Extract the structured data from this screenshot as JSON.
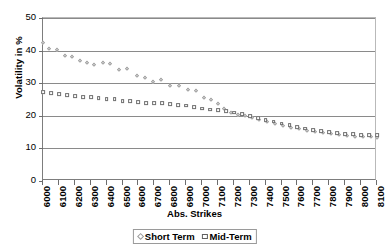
{
  "chart_data": {
    "type": "scatter",
    "title": "",
    "xlabel": "Abs. Strikes",
    "ylabel": "Volatility in %",
    "ylim": [
      0,
      50
    ],
    "ytick_labels": [
      "50",
      "40",
      "30",
      "20",
      "10",
      "0"
    ],
    "ytick_values": [
      50,
      40,
      30,
      20,
      10,
      0
    ],
    "grid": "horizontal",
    "legend_position": "bottom",
    "xtick_labels": [
      "6000",
      "6100",
      "6200",
      "6300",
      "6400",
      "6500",
      "6600",
      "6700",
      "6800",
      "6900",
      "7000",
      "7100",
      "7200",
      "7300",
      "7400",
      "7500",
      "7600",
      "7700",
      "7800",
      "7900",
      "8000",
      "8100"
    ],
    "x_min": 6000,
    "x_max": 8100,
    "series": [
      {
        "name": "Short Term",
        "marker": "diamond",
        "color": "#9a9a9a",
        "points": [
          [
            6000,
            42.3
          ],
          [
            6040,
            40.6
          ],
          [
            6085,
            40.2
          ],
          [
            6140,
            38.4
          ],
          [
            6185,
            37.9
          ],
          [
            6230,
            36.8
          ],
          [
            6275,
            36.3
          ],
          [
            6320,
            35.7
          ],
          [
            6375,
            36.2
          ],
          [
            6420,
            36.0
          ],
          [
            6480,
            34.0
          ],
          [
            6530,
            34.3
          ],
          [
            6590,
            32.1
          ],
          [
            6640,
            31.7
          ],
          [
            6690,
            30.4
          ],
          [
            6740,
            30.9
          ],
          [
            6800,
            29.1
          ],
          [
            6855,
            29.2
          ],
          [
            6910,
            27.8
          ],
          [
            6960,
            27.6
          ],
          [
            7010,
            25.4
          ],
          [
            7055,
            24.7
          ],
          [
            7100,
            23.6
          ],
          [
            7140,
            22.1
          ],
          [
            7180,
            21.0
          ],
          [
            7225,
            20.3
          ],
          [
            7270,
            19.8
          ],
          [
            7315,
            19.3
          ],
          [
            7360,
            18.7
          ],
          [
            7410,
            18.2
          ],
          [
            7460,
            17.5
          ],
          [
            7510,
            17.0
          ],
          [
            7560,
            16.3
          ],
          [
            7610,
            15.8
          ],
          [
            7660,
            15.4
          ],
          [
            7710,
            15.0
          ],
          [
            7760,
            14.6
          ],
          [
            7810,
            14.3
          ],
          [
            7860,
            14.0
          ],
          [
            7910,
            13.8
          ],
          [
            7960,
            13.6
          ],
          [
            8010,
            13.5
          ],
          [
            8060,
            13.4
          ],
          [
            8100,
            13.3
          ]
        ]
      },
      {
        "name": "Mid-Term",
        "marker": "square",
        "color": "#6f6f6f",
        "points": [
          [
            6000,
            27.3
          ],
          [
            6050,
            26.9
          ],
          [
            6100,
            26.7
          ],
          [
            6150,
            26.4
          ],
          [
            6200,
            26.1
          ],
          [
            6250,
            25.8
          ],
          [
            6300,
            25.7
          ],
          [
            6350,
            25.5
          ],
          [
            6400,
            25.2
          ],
          [
            6450,
            25.1
          ],
          [
            6500,
            24.6
          ],
          [
            6550,
            24.5
          ],
          [
            6600,
            24.2
          ],
          [
            6650,
            24.0
          ],
          [
            6700,
            23.9
          ],
          [
            6750,
            23.8
          ],
          [
            6800,
            23.6
          ],
          [
            6850,
            23.3
          ],
          [
            6900,
            23.1
          ],
          [
            6950,
            22.6
          ],
          [
            7000,
            22.2
          ],
          [
            7050,
            21.9
          ],
          [
            7100,
            21.7
          ],
          [
            7150,
            21.4
          ],
          [
            7200,
            21.0
          ],
          [
            7250,
            20.4
          ],
          [
            7300,
            20.0
          ],
          [
            7350,
            19.3
          ],
          [
            7400,
            18.7
          ],
          [
            7450,
            18.2
          ],
          [
            7500,
            17.6
          ],
          [
            7550,
            17.1
          ],
          [
            7600,
            16.5
          ],
          [
            7650,
            16.1
          ],
          [
            7700,
            15.7
          ],
          [
            7750,
            15.3
          ],
          [
            7800,
            15.0
          ],
          [
            7850,
            14.7
          ],
          [
            7900,
            14.5
          ],
          [
            7950,
            14.3
          ],
          [
            8000,
            14.2
          ],
          [
            8050,
            14.1
          ],
          [
            8100,
            14.0
          ]
        ]
      }
    ]
  },
  "axis": {
    "y_title": "Volatility in %",
    "x_title": "Abs. Strikes"
  },
  "legend": {
    "items": [
      {
        "label": "Short Term",
        "marker": "diamond-marker-icon"
      },
      {
        "label": "Mid-Term",
        "marker": "square-marker-icon"
      }
    ]
  }
}
